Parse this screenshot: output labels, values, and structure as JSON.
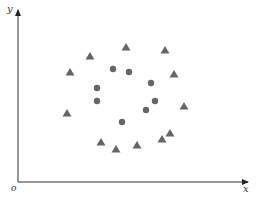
{
  "chart_data": {
    "type": "scatter",
    "title": "",
    "xlabel": "x",
    "ylabel": "y",
    "origin_label": "o",
    "grid": false,
    "legend": null,
    "axes": {
      "origin_px": [
        18,
        182
      ],
      "x_end_px": 248,
      "y_end_px": 10,
      "color": "#333333"
    },
    "series": [
      {
        "name": "triangles",
        "marker": "triangle",
        "color": "#666666",
        "points_px": [
          [
            90,
            56
          ],
          [
            126,
            47
          ],
          [
            165,
            50
          ],
          [
            70,
            72
          ],
          [
            174,
            74
          ],
          [
            184,
            106
          ],
          [
            67,
            113
          ],
          [
            101,
            142
          ],
          [
            116,
            149
          ],
          [
            137,
            145
          ],
          [
            162,
            139
          ],
          [
            170,
            133
          ]
        ]
      },
      {
        "name": "circles",
        "marker": "circle",
        "color": "#666666",
        "points_px": [
          [
            113,
            69
          ],
          [
            129,
            72
          ],
          [
            97,
            88
          ],
          [
            151,
            83
          ],
          [
            97,
            101
          ],
          [
            155,
            101
          ],
          [
            146,
            110
          ],
          [
            122,
            122
          ]
        ]
      }
    ]
  }
}
